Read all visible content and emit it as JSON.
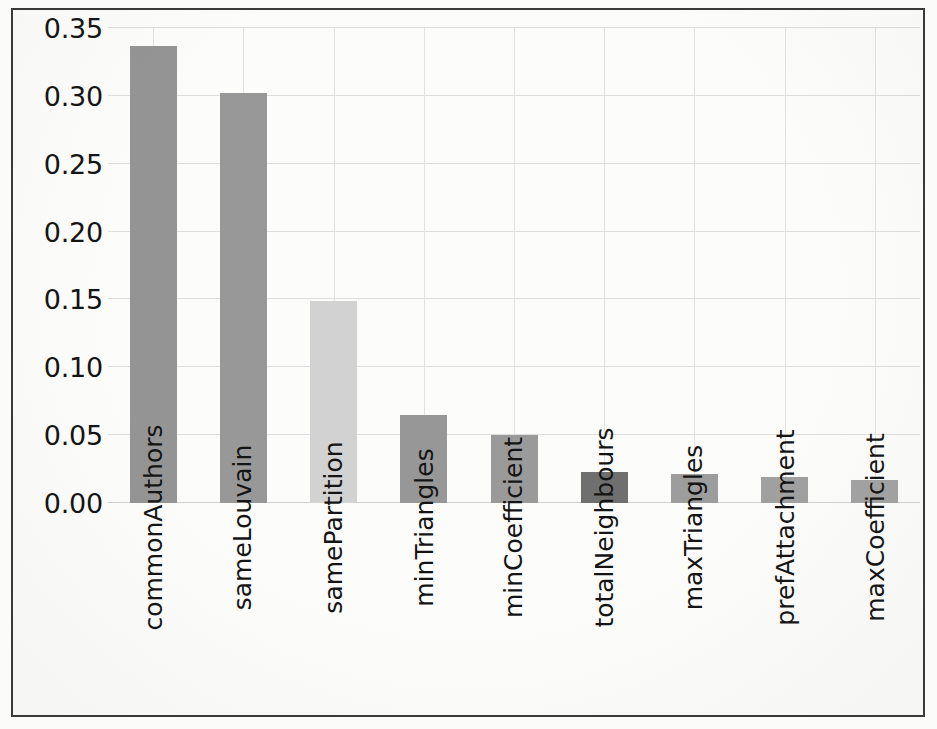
{
  "figure": {
    "background_color": "#fcfcfb",
    "frame_color": "#3a3a3a",
    "grid_color": "#dedede"
  },
  "chart_data": {
    "type": "bar",
    "title": "",
    "subtitle": "",
    "xlabel": "",
    "ylabel": "",
    "categories": [
      "commonAuthors",
      "sameLouvain",
      "samePartition",
      "minTriangles",
      "minCoefficient",
      "totalNeighbours",
      "maxTriangles",
      "prefAttachment",
      "maxCoefficient"
    ],
    "values": [
      0.337,
      0.302,
      0.149,
      0.065,
      0.05,
      0.023,
      0.021,
      0.019,
      0.017
    ],
    "bar_colors": [
      "#949494",
      "#989898",
      "#d2d2d2",
      "#979797",
      "#9a9a9a",
      "#6f6f6f",
      "#9d9d9d",
      "#a0a0a0",
      "#a2a2a2"
    ],
    "ylim": [
      0.0,
      0.35
    ],
    "yticks": [
      0.0,
      0.05,
      0.1,
      0.15,
      0.2,
      0.25,
      0.3,
      0.35
    ],
    "ytick_labels": [
      "0.00",
      "0.05",
      "0.10",
      "0.15",
      "0.20",
      "0.25",
      "0.30",
      "0.35"
    ],
    "grid": true,
    "grid_axis": "both",
    "legend": false,
    "legend_position": "none",
    "xtick_rotation": 90
  }
}
